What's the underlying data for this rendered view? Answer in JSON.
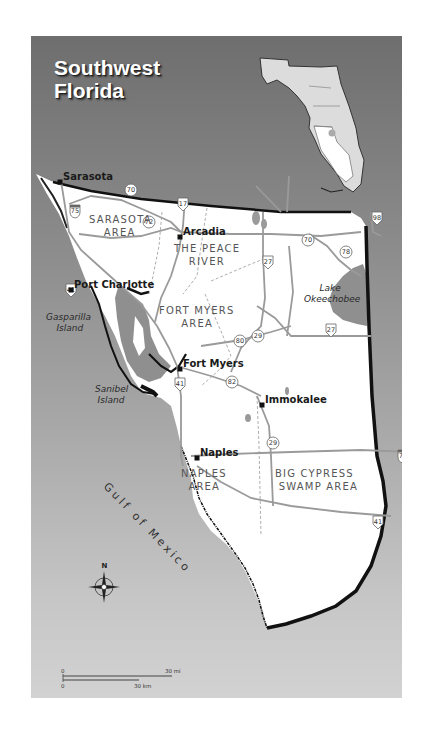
{
  "title": {
    "line1": "Southwest",
    "line2": "Florida"
  },
  "inset": {
    "label": "Florida state locator",
    "highlight": "Southwest Florida region"
  },
  "cities": [
    {
      "name": "Sarasota",
      "x": 29,
      "y": 146
    },
    {
      "name": "Arcadia",
      "x": 149,
      "y": 201
    },
    {
      "name": "Port Charlotte",
      "x": 40,
      "y": 254
    },
    {
      "name": "Fort Myers",
      "x": 149,
      "y": 333
    },
    {
      "name": "Immokalee",
      "x": 231,
      "y": 369
    },
    {
      "name": "Naples",
      "x": 166,
      "y": 422
    }
  ],
  "areas": [
    {
      "line1": "SARASOTA",
      "line2": "AREA",
      "x": 58,
      "y": 187
    },
    {
      "line1": "THE PEACE",
      "line2": "RIVER",
      "x": 143,
      "y": 216
    },
    {
      "line1": "FORT MYERS",
      "line2": "AREA",
      "x": 128,
      "y": 278
    },
    {
      "line1": "NAPLES",
      "line2": "AREA",
      "x": 150,
      "y": 441
    },
    {
      "line1": "BIG CYPRESS",
      "line2": "SWAMP AREA",
      "x": 244,
      "y": 441
    }
  ],
  "water_labels": [
    {
      "line1": "Lake",
      "line2": "Okeechobee",
      "x": 273,
      "y": 255
    },
    {
      "line1": "Gasparilla",
      "line2": "Island",
      "x": 15,
      "y": 284
    },
    {
      "line1": "Sanibel",
      "line2": "Island",
      "x": 64,
      "y": 356
    }
  ],
  "gulf_label": "Gulf of Mexico",
  "highways": [
    {
      "num": "75",
      "x": 44,
      "y": 175,
      "type": "interstate"
    },
    {
      "num": "70",
      "x": 100,
      "y": 154,
      "type": "state"
    },
    {
      "num": "17",
      "x": 152,
      "y": 168,
      "type": "us"
    },
    {
      "num": "72",
      "x": 118,
      "y": 186,
      "type": "state"
    },
    {
      "num": "70",
      "x": 277,
      "y": 204,
      "type": "state"
    },
    {
      "num": "98",
      "x": 346,
      "y": 182,
      "type": "us"
    },
    {
      "num": "78",
      "x": 315,
      "y": 216,
      "type": "state"
    },
    {
      "num": "27",
      "x": 237,
      "y": 226,
      "type": "us"
    },
    {
      "num": "41",
      "x": 40,
      "y": 254,
      "type": "us"
    },
    {
      "num": "29",
      "x": 227,
      "y": 300,
      "type": "state"
    },
    {
      "num": "27",
      "x": 300,
      "y": 294,
      "type": "us"
    },
    {
      "num": "80",
      "x": 209,
      "y": 305,
      "type": "state"
    },
    {
      "num": "41",
      "x": 149,
      "y": 348,
      "type": "us"
    },
    {
      "num": "82",
      "x": 201,
      "y": 346,
      "type": "state"
    },
    {
      "num": "29",
      "x": 242,
      "y": 407,
      "type": "state"
    },
    {
      "num": "75",
      "x": 372,
      "y": 420,
      "type": "interstate"
    },
    {
      "num": "41",
      "x": 347,
      "y": 486,
      "type": "us"
    }
  ],
  "compass": {
    "label": "N"
  },
  "scale": {
    "mi_start": "0",
    "mi_end": "30 mi",
    "km_start": "0",
    "km_end": "30 km"
  },
  "colors": {
    "water": "#8f8f8f",
    "land": "#ffffff",
    "coast": "#111111",
    "road": "#9a9a9a"
  }
}
